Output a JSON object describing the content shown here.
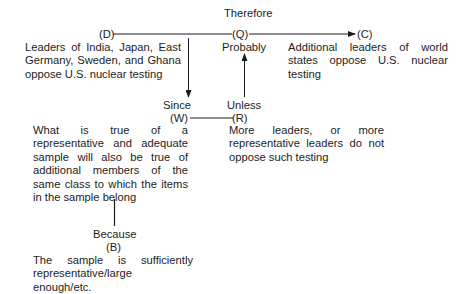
{
  "diagram": {
    "type": "Toulmin argument model",
    "connectives": {
      "therefore": "Therefore",
      "probably": "Probably",
      "since": "Since",
      "unless": "Unless",
      "because": "Because"
    },
    "nodes": {
      "data": {
        "label": "(D)",
        "text": "Leaders of India, Japan, East Germany, Sweden, and Ghana oppose U.S. nuclear testing"
      },
      "qualifier": {
        "label": "(Q)"
      },
      "claim": {
        "label": "(C)",
        "text": "Additional leaders of world states oppose U.S. nuclear testing"
      },
      "warrant": {
        "label": "(W)",
        "text": "What is true of a representative and adequate sample will also be true of additional members of the same class to which the items in the sample belong"
      },
      "rebuttal": {
        "label": "(R)",
        "text": "More leaders, or more representative leaders do not oppose such testing"
      },
      "backing": {
        "label": "(B)",
        "text": "The sample is sufficiently representative/large enough/etc."
      }
    },
    "edges": [
      {
        "from": "D",
        "to": "Q",
        "style": "line"
      },
      {
        "from": "Q",
        "to": "C",
        "style": "arrow"
      },
      {
        "from": "D-Q line",
        "to": "W",
        "style": "arrow-down"
      },
      {
        "from": "W",
        "to": "R",
        "style": "line"
      },
      {
        "from": "R",
        "to": "Q",
        "style": "arrow-up"
      },
      {
        "from": "W",
        "to": "B",
        "style": "line"
      }
    ],
    "colors": {
      "ink": "#1c1c1c",
      "background": "#ffffff"
    }
  }
}
